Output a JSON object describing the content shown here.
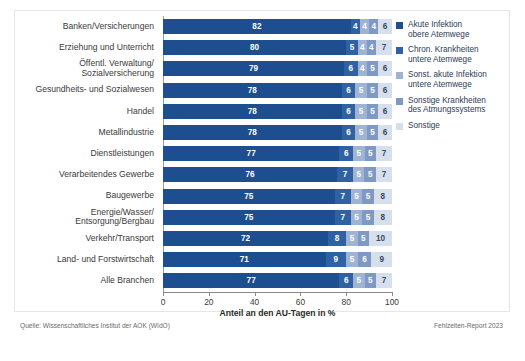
{
  "chart_data": {
    "type": "bar",
    "orientation": "horizontal",
    "stacked": true,
    "normalized_percent": true,
    "title": "",
    "xlabel": "Anteil an den AU-Tagen in %",
    "ylabel": "",
    "xlim": [
      0,
      100
    ],
    "xticks": [
      0,
      20,
      40,
      60,
      80,
      100
    ],
    "xtick_labels": [
      "0",
      "20",
      "40",
      "60",
      "80",
      "100"
    ],
    "grid": false,
    "legend_position": "right",
    "categories": [
      "Banken/Versicherungen",
      "Erziehung und Unterricht",
      "Öffentl. Verwaltung/\nSozialversicherung",
      "Gesundheits- und Sozialwesen",
      "Handel",
      "Metallindustrie",
      "Dienstleistungen",
      "Verarbeitendes Gewerbe",
      "Baugewerbe",
      "Energie/Wasser/\nEntsorgung/Bergbau",
      "Verkehr/Transport",
      "Land- und Forstwirtschaft",
      "Alle Branchen"
    ],
    "series": [
      {
        "name": "Akute Infektion\nobere Atemwege",
        "color": "#1d4e8f",
        "values": [
          82,
          80,
          79,
          78,
          78,
          78,
          77,
          76,
          75,
          75,
          72,
          71,
          77
        ]
      },
      {
        "name": "Chron. Krankheiten\nuntere Atemwege",
        "color": "#2e62a4",
        "values": [
          4,
          5,
          6,
          6,
          6,
          6,
          6,
          7,
          7,
          7,
          8,
          9,
          6
        ]
      },
      {
        "name": "Sonst. akute Infektion\nuntere Atemwege",
        "color": "#9fb4d4",
        "values": [
          4,
          4,
          4,
          5,
          5,
          5,
          5,
          5,
          5,
          5,
          5,
          5,
          5
        ]
      },
      {
        "name": "Sonstige Krankheiten\ndes Atmungssystems",
        "color": "#7d99c4",
        "values": [
          4,
          4,
          5,
          5,
          5,
          5,
          5,
          5,
          5,
          5,
          5,
          6,
          5
        ]
      },
      {
        "name": "Sonstige",
        "color": "#d6dfec",
        "values": [
          6,
          7,
          6,
          6,
          6,
          6,
          7,
          7,
          8,
          8,
          10,
          9,
          7
        ]
      }
    ]
  },
  "footer": {
    "source": "Quelle: Wissenschaftliches Institut der AOK (WIdO)",
    "report": "Fehlzeiten-Report 2023"
  }
}
